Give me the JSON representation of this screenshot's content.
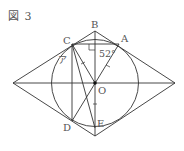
{
  "figure": {
    "title": "図 3",
    "labels": {
      "A": "A",
      "B": "B",
      "C": "C",
      "D": "D",
      "E": "E",
      "O": "O"
    },
    "angle_label": "52°",
    "unknown_label": "ア",
    "colors": {
      "stroke": "#333333",
      "label": "#555555"
    }
  }
}
